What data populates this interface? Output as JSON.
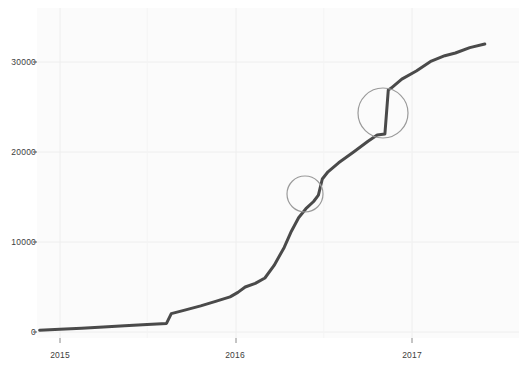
{
  "chart_data": {
    "type": "line",
    "title": "",
    "subtitle": "",
    "xlabel": "",
    "ylabel": "",
    "grid": true,
    "legend": null,
    "legend_position": "none",
    "line_color": "#4a4a4a",
    "panel_background": "#fbfbfb",
    "gridline_color": "#eeeeee",
    "xlim": [
      "2014-10-01",
      "2017-07-01"
    ],
    "ylim": [
      0,
      33500
    ],
    "yticks": [
      0,
      10000,
      20000,
      30000
    ],
    "ytick_labels": [
      "0",
      "10000",
      "20000",
      "30000"
    ],
    "xticks": [
      "2015",
      "2016",
      "2017"
    ],
    "xtick_labels": [
      "2015",
      "2016",
      "2017"
    ],
    "x": [
      "2014-11-20",
      "2015-01-01",
      "2015-02-15",
      "2015-04-01",
      "2015-05-15",
      "2015-07-01",
      "2015-08-10",
      "2015-08-20",
      "2015-09-15",
      "2015-10-20",
      "2015-11-20",
      "2015-12-20",
      "2016-01-05",
      "2016-01-20",
      "2016-02-10",
      "2016-03-01",
      "2016-03-20",
      "2016-04-10",
      "2016-04-25",
      "2016-05-10",
      "2016-05-25",
      "2016-06-10",
      "2016-06-20",
      "2016-06-28",
      "2016-07-10",
      "2016-08-01",
      "2016-09-01",
      "2016-10-01",
      "2016-10-20",
      "2016-11-05",
      "2016-11-12",
      "2016-11-18",
      "2016-12-10",
      "2017-01-10",
      "2017-02-10",
      "2017-03-10",
      "2017-04-01",
      "2017-05-01",
      "2017-06-01"
    ],
    "y": [
      200,
      300,
      420,
      560,
      700,
      850,
      950,
      2050,
      2400,
      2900,
      3400,
      3900,
      4400,
      5000,
      5400,
      6000,
      7400,
      9400,
      11200,
      12700,
      13700,
      14500,
      15200,
      17000,
      17800,
      18800,
      20000,
      21200,
      21900,
      22000,
      26900,
      27100,
      28100,
      29000,
      30100,
      30700,
      31000,
      31600,
      32000
    ],
    "annotations": [
      {
        "name": "jump-circle-1",
        "shape": "circle",
        "x_label": "2016-06-25",
        "y_value": 15300,
        "radius_px": 18,
        "center_px": [
          305,
          194
        ],
        "stroke": "#9a9a9a"
      },
      {
        "name": "jump-circle-2",
        "shape": "circle",
        "x_label": "2016-11-14",
        "y_value": 24300,
        "radius_px": 25,
        "center_px": [
          383,
          113
        ],
        "stroke": "#9a9a9a"
      }
    ],
    "series": [
      {
        "name": "cumulative",
        "color": "#4a4a4a",
        "line_width_px": 3
      }
    ]
  },
  "axes": {
    "y_tick_0": "0",
    "y_tick_1": "10000",
    "y_tick_2": "20000",
    "y_tick_3": "30000",
    "x_tick_0": "2015",
    "x_tick_1": "2016",
    "x_tick_2": "2017"
  }
}
